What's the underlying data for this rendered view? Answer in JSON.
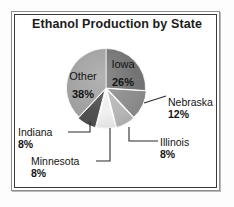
{
  "chart": {
    "title": "Ethanol Production by State"
  },
  "chart_data": {
    "type": "pie",
    "title": "Ethanol Production by State",
    "xlabel": "",
    "ylabel": "",
    "units": "percent",
    "legend": "none",
    "grid": false,
    "labels_inside": [
      "Iowa",
      "Other"
    ],
    "labels_callout": [
      "Nebraska",
      "Illinois",
      "Minnesota",
      "Indiana"
    ],
    "categories": [
      "Iowa",
      "Nebraska",
      "Illinois",
      "Minnesota",
      "Indiana",
      "Other"
    ],
    "values": [
      26,
      12,
      8,
      8,
      8,
      38
    ],
    "slices": [
      {
        "name": "Iowa",
        "value": 26,
        "label": "Iowa",
        "percent_text": "26%",
        "color": "#6e6e6e",
        "start_deg": 0,
        "end_deg": 93.6,
        "label_placement": "inside"
      },
      {
        "name": "Nebraska",
        "value": 12,
        "label": "Nebraska",
        "percent_text": "12%",
        "color": "#8a8a8a",
        "start_deg": 93.6,
        "end_deg": 136.8,
        "label_placement": "callout"
      },
      {
        "name": "Illinois",
        "value": 8,
        "label": "Illinois",
        "percent_text": "8%",
        "color": "#b6b6b6",
        "start_deg": 136.8,
        "end_deg": 165.6,
        "label_placement": "callout"
      },
      {
        "name": "Minnesota",
        "value": 8,
        "label": "Minnesota",
        "percent_text": "8%",
        "color": "#efefef",
        "start_deg": 165.6,
        "end_deg": 194.4,
        "label_placement": "callout"
      },
      {
        "name": "Indiana",
        "value": 8,
        "label": "Indiana",
        "percent_text": "8%",
        "color": "#4a4a4a",
        "start_deg": 194.4,
        "end_deg": 223.2,
        "label_placement": "callout"
      },
      {
        "name": "Other",
        "value": 38,
        "label": "Other",
        "percent_text": "38%",
        "color": "#9d9d9d",
        "start_deg": 223.2,
        "end_deg": 360,
        "label_placement": "inside"
      }
    ]
  },
  "colors": {
    "background": "#ffffff",
    "frame_outer": "#8d8d8d",
    "frame_inner": "#3a3a3a",
    "title_text": "#1b1b1b",
    "label_text": "#141414",
    "leader_line": "#2b2b2b"
  }
}
